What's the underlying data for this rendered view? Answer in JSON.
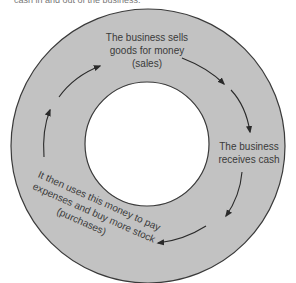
{
  "header": {
    "cut_off_text": "cash in and out of the business."
  },
  "diagram": {
    "type": "cycle",
    "colors": {
      "ring_fill": "#c2c2c2",
      "ring_stroke": "#3a3a3a",
      "center_fill": "#ffffff",
      "arrow": "#2a2a2a",
      "text": "#3a3a3a"
    },
    "steps": [
      {
        "id": "sales",
        "lines": [
          "The business sells",
          "goods for money",
          "(sales)"
        ]
      },
      {
        "id": "cash",
        "lines": [
          "The business",
          "receives cash"
        ]
      },
      {
        "id": "purchases",
        "lines": [
          "It then uses this money to pay",
          "expenses and buy more stock",
          "(purchases)"
        ]
      }
    ],
    "direction": "clockwise"
  }
}
